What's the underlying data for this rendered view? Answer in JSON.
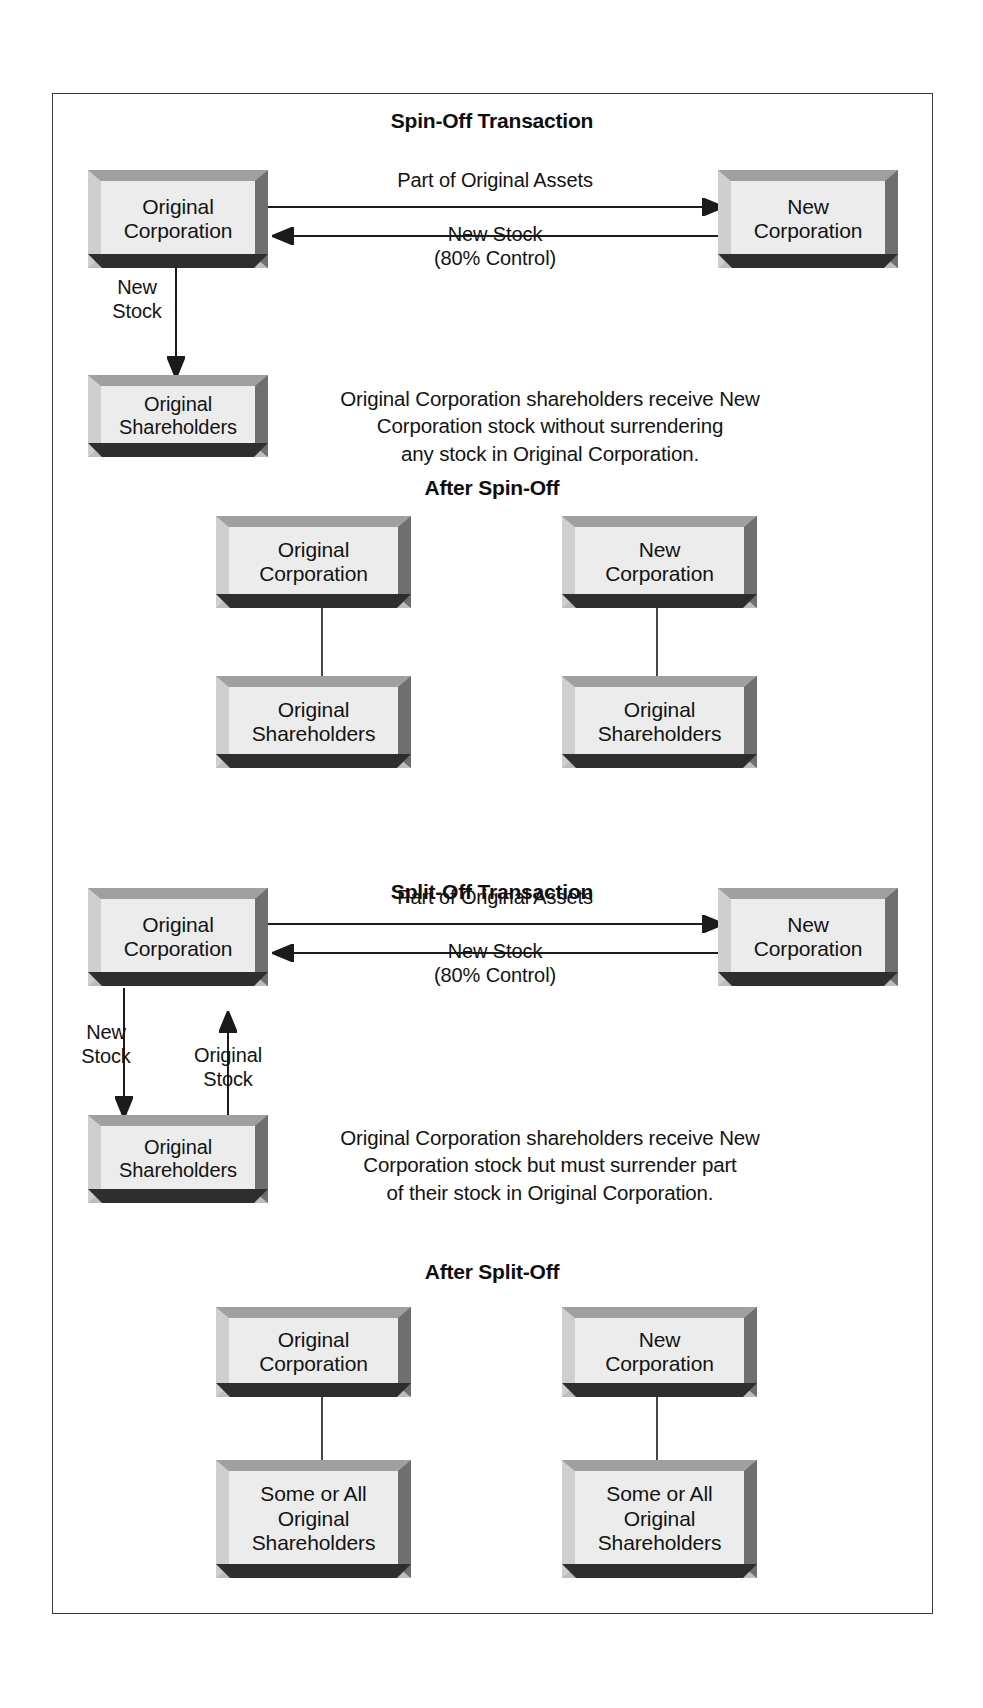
{
  "diagram": {
    "sections": [
      {
        "heading": "Spin-Off Transaction",
        "boxes": {
          "original_corporation": "Original\nCorporation",
          "new_corporation": "New\nCorporation",
          "original_shareholders": "Original\nShareholders"
        },
        "edges": {
          "assets": "Part of Original Assets",
          "new_stock_control": "New Stock\n(80% Control)",
          "new_stock_down": "New\nStock"
        },
        "note": "Original Corporation shareholders receive New\nCorporation stock without surrendering\nany stock in Original Corporation."
      },
      {
        "heading": "After Spin-Off",
        "left": {
          "parent": "Original\nCorporation",
          "child": "Original\nShareholders"
        },
        "right": {
          "parent": "New\nCorporation",
          "child": "Original\nShareholders"
        }
      },
      {
        "heading": "Split-Off Transaction",
        "boxes": {
          "original_corporation": "Original\nCorporation",
          "new_corporation": "New\nCorporation",
          "original_shareholders": "Original\nShareholders"
        },
        "edges": {
          "assets": "Part of Original Assets",
          "new_stock_control": "New Stock\n(80% Control)",
          "new_stock_down": "New\nStock",
          "original_stock_up": "Original\nStock"
        },
        "note": "Original Corporation shareholders receive New\nCorporation stock but must surrender part\nof their stock in Original Corporation."
      },
      {
        "heading": "After Split-Off",
        "left": {
          "parent": "Original\nCorporation",
          "child": "Some or All\nOriginal\nShareholders"
        },
        "right": {
          "parent": "New\nCorporation",
          "child": "Some or All\nOriginal\nShareholders"
        }
      }
    ],
    "colors": {
      "box_face": "#ececec",
      "box_top_bevel": "#a9a9a9",
      "box_bottom_lip": "#2e2e2e",
      "frame_border": "#3a3a3a",
      "text": "#131313",
      "background": "#ffffff"
    }
  }
}
